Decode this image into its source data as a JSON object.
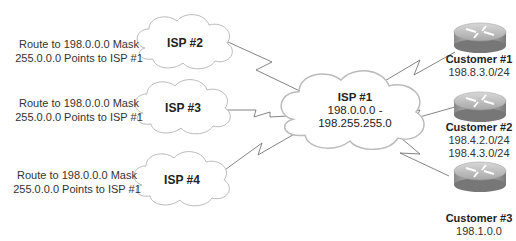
{
  "diagram": {
    "isps": [
      {
        "id": "isp2",
        "label": "ISP #2",
        "route_note_line1": "Route to 198.0.0.0 Mask",
        "route_note_line2": "255.0.0.0 Points to ISP #1"
      },
      {
        "id": "isp3",
        "label": "ISP #3",
        "route_note_line1": "Route to 198.0.0.0 Mask",
        "route_note_line2": "255.0.0.0 Points to ISP #1"
      },
      {
        "id": "isp4",
        "label": "ISP #4",
        "route_note_line1": "Route to 198.0.0.0 Mask",
        "route_note_line2": "255.0.0.0 Points to ISP #1"
      }
    ],
    "isp1": {
      "label": "ISP #1",
      "range_line1": "198.0.0.0 -",
      "range_line2": "198.255.255.0"
    },
    "customers": [
      {
        "label": "Customer #1",
        "prefixes": [
          "198.8.3.0/24"
        ]
      },
      {
        "label": "Customer #2",
        "prefixes": [
          "198.4.2.0/24",
          "198.4.3.0/24"
        ]
      },
      {
        "label": "Customer #3",
        "prefixes": [
          "198.1.0.0"
        ]
      }
    ],
    "icons": {
      "cloud": "cloud-icon",
      "router": "router-icon",
      "link": "serial-link-icon"
    }
  }
}
